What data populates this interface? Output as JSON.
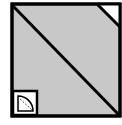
{
  "diagram": {
    "type": "split-square-icon",
    "colors": {
      "background": "#ffffff",
      "fill": "#c8c8c8",
      "stroke": "#000000",
      "corner_cut": "#ffffff"
    },
    "outer_square": {
      "x": 12,
      "y": 4,
      "w": 108,
      "h": 112
    },
    "diagonal": {
      "x1": 12,
      "y1": 5,
      "x2": 120,
      "y2": 116
    },
    "corner_cut": {
      "x1": 97,
      "y1": 4,
      "x2": 120,
      "y2": 27
    },
    "inset_box": {
      "x": 13,
      "y": 91,
      "w": 24,
      "h": 24
    },
    "door_symbol": "door-swing-icon"
  }
}
